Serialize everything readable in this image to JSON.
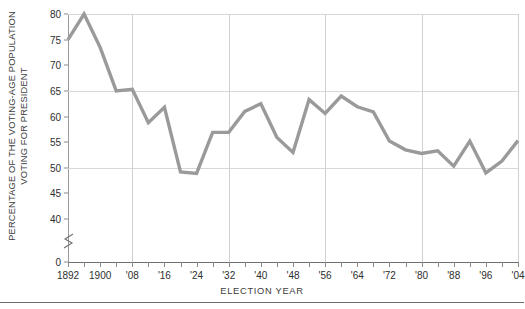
{
  "chart_data": {
    "type": "line",
    "title": "",
    "xlabel": "ELECTION YEAR",
    "ylabel_line1": "PERCENTAGE OF THE VOTING-AGE POPULATION",
    "ylabel_line2": "VOTING FOR PRESIDENT",
    "ylim": [
      0,
      80
    ],
    "y_break": true,
    "y_break_below": 40,
    "ytick_labels": [
      "80",
      "75",
      "70",
      "65",
      "60",
      "55",
      "50",
      "45",
      "40",
      "0"
    ],
    "ytick_values": [
      80,
      75,
      70,
      65,
      60,
      55,
      50,
      45,
      40,
      0
    ],
    "gridlines_h_at": [
      80,
      65,
      50
    ],
    "gridlines_v_at": [
      1908,
      1932,
      1956,
      1980,
      2004
    ],
    "xtick_labels": [
      "1892",
      "1900",
      "'08",
      "'16",
      "'24",
      "'32",
      "'40",
      "'48",
      "'56",
      "'64",
      "'72",
      "'80",
      "'88",
      "'96",
      "'04"
    ],
    "xtick_values": [
      1892,
      1900,
      1908,
      1916,
      1924,
      1932,
      1940,
      1948,
      1956,
      1964,
      1972,
      1980,
      1988,
      1996,
      2004
    ],
    "x_minor_step": 4,
    "x_range": [
      1892,
      2004
    ],
    "line_color": "#9a9a9a",
    "grid_color": "#d8d8d8",
    "axis_color": "#6f6f6f",
    "categories": [
      1892,
      1896,
      1900,
      1904,
      1908,
      1912,
      1916,
      1920,
      1924,
      1928,
      1932,
      1936,
      1940,
      1944,
      1948,
      1952,
      1956,
      1960,
      1964,
      1968,
      1972,
      1976,
      1980,
      1984,
      1988,
      1992,
      1996,
      2000,
      2004
    ],
    "values": [
      75.0,
      80.0,
      73.5,
      65.0,
      65.3,
      58.8,
      61.8,
      49.2,
      48.9,
      56.9,
      56.9,
      61.0,
      62.5,
      55.9,
      53.0,
      63.3,
      60.6,
      64.0,
      61.9,
      60.9,
      55.2,
      53.5,
      52.8,
      53.3,
      50.3,
      55.2,
      49.0,
      51.3,
      55.3
    ]
  },
  "figure": {
    "bottom_rule": true
  }
}
